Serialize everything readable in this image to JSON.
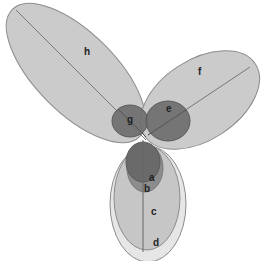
{
  "diagram": {
    "type": "ellipse-venn",
    "colors": {
      "light_fill": "#c8c8c8",
      "lighter_fill": "#e4e4e4",
      "dark_fill": "#6a6a6a",
      "mid_fill": "#8a8a8a",
      "stroke": "#8c8c8c",
      "axis_line": "#7a7a7a",
      "label": "#222222"
    },
    "labels": {
      "a": "a",
      "b": "b",
      "c": "c",
      "d": "d",
      "e": "e",
      "f": "f",
      "g": "g",
      "h": "h"
    }
  }
}
